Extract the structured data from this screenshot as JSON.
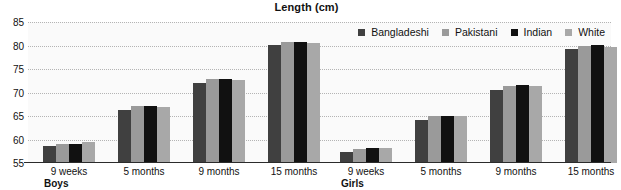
{
  "chart_data": {
    "type": "bar",
    "title": "Length (cm)",
    "xlabel": "",
    "ylabel": "",
    "ylim": [
      55,
      85
    ],
    "yticks": [
      55,
      60,
      65,
      70,
      75,
      80,
      85
    ],
    "grid": true,
    "legend_position": "top-right",
    "panels": [
      {
        "name": "Boys",
        "categories": [
          "9 weeks",
          "5 months",
          "9 months",
          "15 months"
        ]
      },
      {
        "name": "Girls",
        "categories": [
          "9 weeks",
          "5 months",
          "9 months",
          "15 months"
        ]
      }
    ],
    "categories": [
      "9 weeks",
      "5 months",
      "9 months",
      "15 months"
    ],
    "series": [
      {
        "name": "Bangladeshi",
        "color": "#404040",
        "values_boys": [
          58.6,
          66.2,
          72.0,
          80.1
        ],
        "values_girls": [
          57.3,
          64.2,
          70.5,
          79.2
        ]
      },
      {
        "name": "Pakistani",
        "color": "#9a9a9a",
        "values_boys": [
          59.1,
          67.1,
          72.8,
          80.8
        ],
        "values_girls": [
          57.9,
          65.0,
          71.3,
          79.9
        ]
      },
      {
        "name": "Indian",
        "color": "#111111",
        "values_boys": [
          59.1,
          67.1,
          72.8,
          80.8
        ],
        "values_girls": [
          58.3,
          65.1,
          71.5,
          80.1
        ]
      },
      {
        "name": "White",
        "color": "#a8a8a8",
        "values_boys": [
          59.4,
          67.0,
          72.6,
          80.6
        ],
        "values_girls": [
          58.2,
          65.0,
          71.4,
          79.6
        ]
      }
    ]
  },
  "legend": {
    "items": [
      {
        "label": "Bangladeshi",
        "color": "#404040"
      },
      {
        "label": "Pakistani",
        "color": "#9a9a9a"
      },
      {
        "label": "Indian",
        "color": "#111111"
      },
      {
        "label": "White",
        "color": "#a8a8a8"
      }
    ]
  }
}
